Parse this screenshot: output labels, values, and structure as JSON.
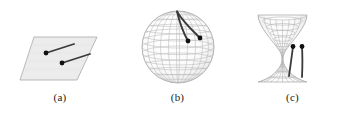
{
  "figure": {
    "background_color": "#ffffff",
    "width": 350,
    "height": 114
  },
  "colors": {
    "geodesic": "#3a3a3a",
    "point": "#111111",
    "mesh_light": "#b9b9b9",
    "mesh_mid": "#9a9a9a",
    "plane_fill": "#ececec",
    "plane_edge": "#a8a8a8",
    "caption_text": "#1a1a1a"
  },
  "panels": [
    {
      "id": "a",
      "caption": "(a)",
      "surface_name": "flat-plane",
      "curvature": "zero",
      "geodesic_count": 2,
      "geodesic_kind": "straight-segment",
      "points": [
        {
          "x": 46,
          "y": 53
        },
        {
          "x": 62,
          "y": 63
        }
      ]
    },
    {
      "id": "b",
      "caption": "(b)",
      "surface_name": "sphere",
      "curvature": "positive",
      "geodesic_count": 2,
      "geodesic_kind": "great-circle-arc",
      "points": [
        {
          "x": 68,
          "y": 41
        },
        {
          "x": 80,
          "y": 38
        }
      ]
    },
    {
      "id": "c",
      "caption": "(c)",
      "surface_name": "hyperboloid",
      "curvature": "negative",
      "geodesic_count": 2,
      "geodesic_kind": "hyperbolic-geodesic",
      "points": [
        {
          "x": 58,
          "y": 46
        },
        {
          "x": 67,
          "y": 46
        }
      ]
    }
  ]
}
